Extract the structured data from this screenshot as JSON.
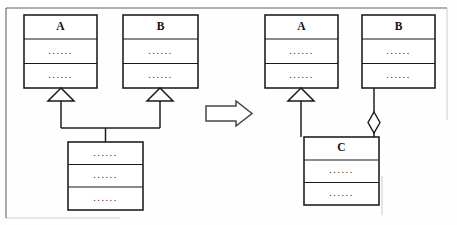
{
  "diagram": {
    "kind": "uml-class-diagram",
    "stroke_color": "#1a1a1a",
    "fill_color": "#ffffff",
    "frame_color": "#3a3a3a",
    "background": "#fefefe",
    "transform_arrow": {
      "name": "transformation-arrow",
      "direction": "right",
      "glyph": "=>"
    },
    "left_side": {
      "label": "before",
      "classes": [
        {
          "name": "A",
          "title": "A",
          "compartments": [
            "......",
            "......"
          ]
        },
        {
          "name": "B",
          "title": "B",
          "compartments": [
            "......",
            "......"
          ]
        },
        {
          "name": "subclass",
          "title": "",
          "compartments": [
            "......",
            "......",
            "......"
          ]
        }
      ],
      "relationships": [
        {
          "type": "generalization",
          "from": "subclass",
          "to": "A",
          "marker": "hollow-triangle"
        },
        {
          "type": "generalization",
          "from": "subclass",
          "to": "B",
          "marker": "hollow-triangle"
        }
      ]
    },
    "right_side": {
      "label": "after",
      "classes": [
        {
          "name": "A",
          "title": "A",
          "compartments": [
            "......",
            "......"
          ]
        },
        {
          "name": "B",
          "title": "B",
          "compartments": [
            "......",
            "......"
          ]
        },
        {
          "name": "C",
          "title": "C",
          "compartments": [
            "......",
            "......"
          ]
        }
      ],
      "relationships": [
        {
          "type": "generalization",
          "from": "C",
          "to": "A",
          "marker": "hollow-triangle"
        },
        {
          "type": "aggregation",
          "from": "B",
          "to": "C",
          "marker": "hollow-diamond"
        }
      ]
    }
  }
}
